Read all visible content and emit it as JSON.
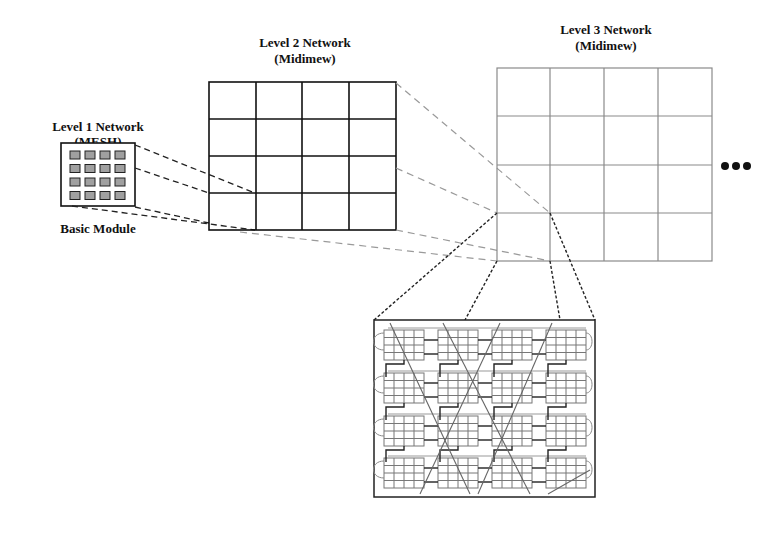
{
  "diagram": {
    "level1": {
      "title": "Level 1 Network",
      "subtitle": "(MESH)",
      "caption": "Basic Module"
    },
    "level2": {
      "title": "Level 2 Network",
      "subtitle": "(Midimew)",
      "rows": 4,
      "cols": 4
    },
    "level3": {
      "title": "Level 3 Network",
      "subtitle": "(Midimew)",
      "rows": 4,
      "cols": 4,
      "continuation": "•••"
    },
    "expanded_view": {
      "module_rows": 4,
      "module_cols": 4,
      "mesh_per_module": "4x4"
    },
    "colors": {
      "level2_grid": "#111111",
      "level3_grid": "#8a8a8a",
      "projection_dark": "#222222",
      "projection_light": "#9a9a9a",
      "module_fill": "#9e9e9e"
    }
  }
}
